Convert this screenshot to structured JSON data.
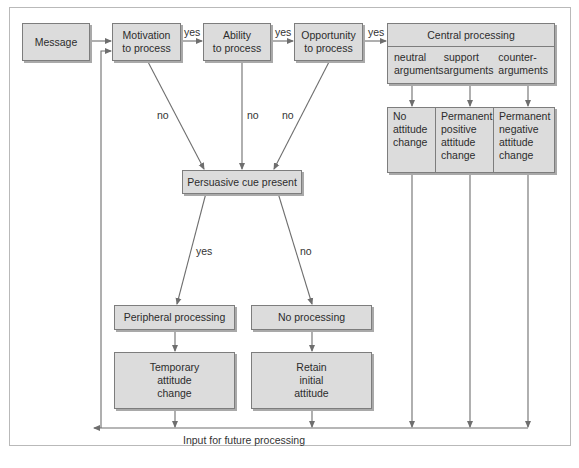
{
  "diagram": {
    "nodes": {
      "message": "Message",
      "motivation": "Motivation\nto process",
      "ability": "Ability\nto process",
      "opportunity": "Opportunity\nto process",
      "central_processing": {
        "title": "Central processing",
        "columns": [
          "neutral\narguments",
          "support\narguments",
          "counter-\narguments"
        ]
      },
      "outcomes": [
        "No\nattitude\nchange",
        "Permanent\npositive\nattitude\nchange",
        "Permanent\nnegative\nattitude\nchange"
      ],
      "persuasive_cue": "Persuasive cue present",
      "peripheral_processing": "Peripheral processing",
      "no_processing": "No processing",
      "temporary_change": "Temporary\nattitude\nchange",
      "retain_attitude": "Retain\ninitial\nattitude"
    },
    "edge_labels": {
      "motivation_yes": "yes",
      "ability_yes": "yes",
      "opportunity_yes": "yes",
      "motivation_no": "no",
      "ability_no": "no",
      "opportunity_no": "no",
      "cue_yes": "yes",
      "cue_no": "no"
    },
    "feedback_label": "Input for future processing",
    "colors": {
      "box_fill": "#dcdcdc",
      "box_border": "#7d7d7d",
      "line": "#6e6e6e",
      "frame": "#b9b9b9"
    }
  }
}
